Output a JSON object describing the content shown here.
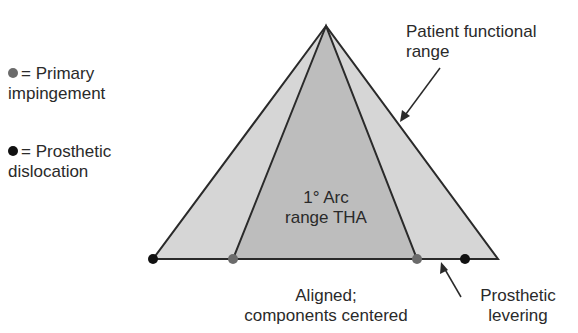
{
  "legend": {
    "primary_impingement": {
      "symbol": "=",
      "line1": "Primary",
      "line2": "impingement",
      "color": "#6b6b6b"
    },
    "prosthetic_dislocation": {
      "symbol": "=",
      "line1": "Prosthetic",
      "line2": "dislocation",
      "color": "#111111"
    }
  },
  "labels": {
    "patient_functional_range": {
      "line1": "Patient functional",
      "line2": "range"
    },
    "arc_range": {
      "line1": "1° Arc",
      "line2": "range THA"
    },
    "aligned": {
      "line1": "Aligned;",
      "line2": "components centered"
    },
    "prosthetic_levering": {
      "line1": "Prosthetic",
      "line2": "levering"
    }
  },
  "colors": {
    "outer_fill": "#d6d6d6",
    "inner_fill": "#b9b9b9",
    "line": "#2a2a2a"
  }
}
